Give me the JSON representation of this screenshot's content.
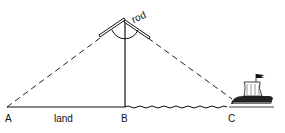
{
  "diagram": {
    "title": "",
    "points": {
      "A": {
        "label": "A"
      },
      "B": {
        "label": "B"
      },
      "C": {
        "label": "C"
      }
    },
    "labels": {
      "rod": "rod",
      "land": "land"
    },
    "colors": {
      "line": "#111111",
      "background": "#ffffff"
    }
  }
}
